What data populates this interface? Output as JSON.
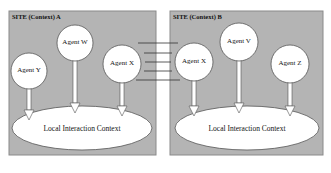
{
  "diagram": {
    "sites": [
      {
        "label": "SITE (Context) A",
        "context_label": "Local Interaction Context",
        "agents": [
          "Agent Y",
          "Agent W",
          "Agent X"
        ]
      },
      {
        "label": "SITE (Context) B",
        "context_label": "Local Interaction Context",
        "agents": [
          "Agent X",
          "Agent V",
          "Agent Z"
        ]
      }
    ],
    "connections": {
      "from": "Agent X (Site A)",
      "to": "Agent X (Site B)",
      "line_count": 5
    },
    "colors": {
      "site_fill": "#b4b4b4",
      "site_border": "#8a8a8a",
      "node_fill": "#ffffff",
      "line": "#333333"
    }
  }
}
